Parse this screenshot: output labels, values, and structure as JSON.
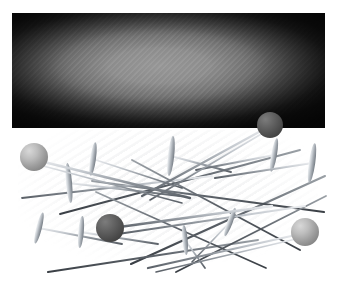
{
  "scene": {
    "title": "Straight pins scattered beside a dark textured panel",
    "width": 337,
    "height": 293,
    "background_color": "#ffffff"
  },
  "panel": {
    "label": "dark gradient rectangle",
    "x": 12,
    "y": 13,
    "width": 313,
    "height": 115,
    "center_color": "#9a9a9a",
    "edge_color": "#141414",
    "texture": "diagonal weave"
  },
  "pins": {
    "label": "scattered straight pins",
    "count": 16,
    "shaft_color": "#9aa0a6",
    "shaft_shadow_color": "#4a4f55",
    "ball_head_light_color": "#b6b6b6",
    "ball_head_dark_color": "#5d5d5d",
    "flat_head_color": "#b9bdc2",
    "items": [
      {
        "id": "pin-ball-light-topleft",
        "head": "ball",
        "tone": "light",
        "hx": 34,
        "hy": 157,
        "r": 14,
        "tx": 185,
        "ty": 196
      },
      {
        "id": "pin-ball-dark-topright",
        "head": "ball",
        "tone": "dark",
        "hx": 270,
        "hy": 125,
        "r": 13,
        "tx": 132,
        "ty": 196
      },
      {
        "id": "pin-ball-dark-center",
        "head": "ball",
        "tone": "dark",
        "hx": 110,
        "hy": 228,
        "r": 14,
        "tx": 268,
        "ty": 205
      },
      {
        "id": "pin-ball-light-right",
        "head": "ball",
        "tone": "light",
        "hx": 305,
        "hy": 232,
        "r": 14,
        "tx": 150,
        "ty": 271
      },
      {
        "id": "pin-flat-a",
        "head": "flat",
        "tone": "light",
        "hx": 93,
        "hy": 159,
        "angle": -72,
        "len": 96,
        "hw": 17
      },
      {
        "id": "pin-flat-b",
        "head": "flat",
        "tone": "light",
        "hx": 171,
        "hy": 156,
        "angle": -83,
        "len": 120,
        "hw": 20
      },
      {
        "id": "pin-flat-c",
        "head": "flat",
        "tone": "light",
        "hx": 274,
        "hy": 155,
        "angle": -80,
        "len": 96,
        "hw": 17
      },
      {
        "id": "pin-flat-d",
        "head": "flat",
        "tone": "light",
        "hx": 312,
        "hy": 163,
        "angle": -74,
        "len": 106,
        "hw": 20
      },
      {
        "id": "pin-flat-e",
        "head": "flat",
        "tone": "light",
        "hx": 69,
        "hy": 183,
        "angle": -96,
        "len": 112,
        "hw": 20
      },
      {
        "id": "pin-flat-f",
        "head": "flat",
        "tone": "light",
        "hx": 39,
        "hy": 228,
        "angle": -57,
        "len": 88,
        "hw": 16
      },
      {
        "id": "pin-flat-g",
        "head": "flat",
        "tone": "light",
        "hx": 81,
        "hy": 232,
        "angle": -75,
        "len": 80,
        "hw": 16
      },
      {
        "id": "pin-flat-h",
        "head": "flat",
        "tone": "light",
        "hx": 185,
        "hy": 240,
        "angle": -96,
        "len": 76,
        "hw": 15
      },
      {
        "id": "pin-flat-i",
        "head": "flat",
        "tone": "light",
        "hx": 230,
        "hy": 222,
        "angle": -62,
        "len": 72,
        "hw": 15
      },
      {
        "id": "pin-shaft-long-a",
        "head": "none",
        "x1": 131,
        "y1": 264,
        "x2": 325,
        "y2": 176
      },
      {
        "id": "pin-shaft-long-b",
        "head": "none",
        "x1": 48,
        "y1": 272,
        "x2": 255,
        "y2": 240
      },
      {
        "id": "pin-shaft-long-c",
        "head": "none",
        "x1": 92,
        "y1": 181,
        "x2": 324,
        "y2": 210
      }
    ]
  }
}
